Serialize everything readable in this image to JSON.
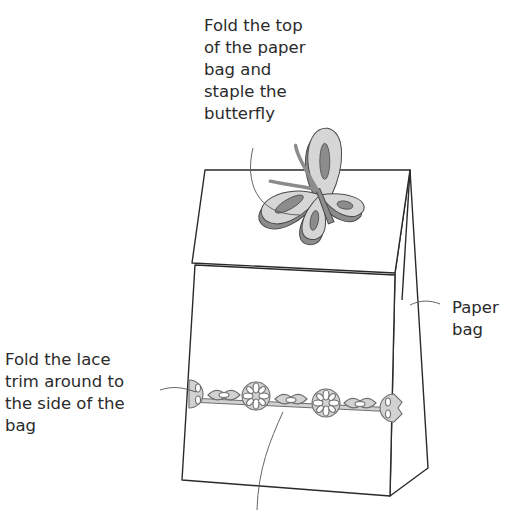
{
  "diagram": {
    "labels": {
      "butterfly": "Fold the top\nof the paper\nbag and\nstaple the\nbutterfly",
      "bag": "Paper\nbag",
      "lace": "Fold the lace\ntrim around to\nthe side of the\nbag"
    },
    "colors": {
      "line": "#2a2a2a",
      "paper": "#ffffff",
      "butterfly_dark": "#8c8c8c",
      "butterfly_light": "#d6d6d6",
      "lace_fill": "#d2d2d2",
      "lace_outline": "#6e6e6e"
    }
  }
}
